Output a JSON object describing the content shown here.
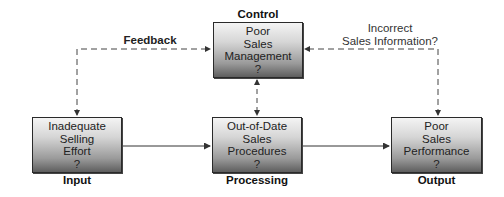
{
  "diagram": {
    "nodes": {
      "control": {
        "role_label": "Control",
        "lines": [
          "Poor",
          "Sales",
          "Management",
          "?"
        ]
      },
      "input": {
        "role_label": "Input",
        "lines": [
          "Inadequate",
          "Selling",
          "Effort",
          "?"
        ]
      },
      "processing": {
        "role_label": "Processing",
        "lines": [
          "Out-of-Date",
          "Sales",
          "Procedures",
          "?"
        ]
      },
      "output": {
        "role_label": "Output",
        "lines": [
          "Poor",
          "Sales",
          "Performance",
          "?"
        ]
      }
    },
    "annotations": {
      "feedback": "Feedback",
      "incorrect_info_line1": "Incorrect",
      "incorrect_info_line2": "Sales Information?"
    },
    "edges": [
      {
        "from": "input",
        "to": "processing",
        "style": "solid"
      },
      {
        "from": "processing",
        "to": "output",
        "style": "solid"
      },
      {
        "from": "input",
        "to": "control",
        "style": "dashed",
        "label": "Feedback",
        "bidirectional": true
      },
      {
        "from": "output",
        "to": "control",
        "style": "dashed",
        "label": "Incorrect Sales Information?",
        "bidirectional": true
      },
      {
        "from": "control",
        "to": "processing",
        "style": "dashed",
        "bidirectional": true
      }
    ]
  }
}
